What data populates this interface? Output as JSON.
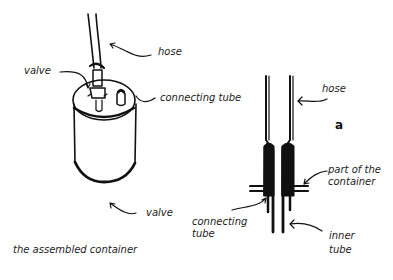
{
  "figure": {
    "left_panel": {
      "caption": "the assembled container",
      "labels": {
        "hose": "hose",
        "valve_top": "valve",
        "connecting_tube": "connecting tube",
        "valve_bottom": "valve"
      }
    },
    "right_panel": {
      "panel_letter": "a",
      "labels": {
        "hose": "hose",
        "part_of_container_line1": "part of the",
        "part_of_container_line2": "container",
        "connecting_tube_line1": "connecting",
        "connecting_tube_line2": "tube",
        "inner_tube_line1": "inner",
        "inner_tube_line2": "tube"
      }
    }
  }
}
